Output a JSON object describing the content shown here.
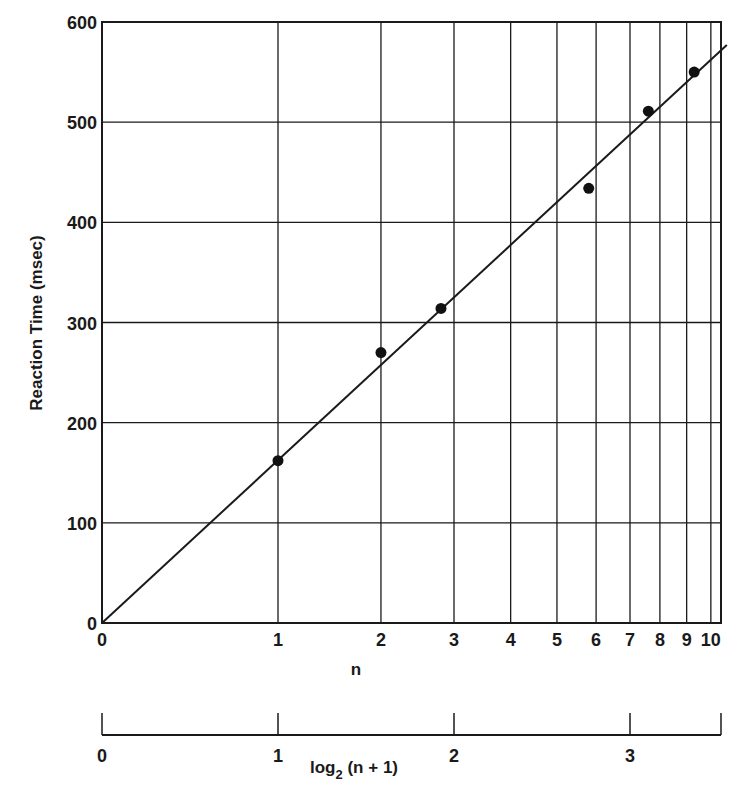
{
  "chart_data": {
    "type": "scatter",
    "title": "",
    "xlabel": "n",
    "xlabel_secondary": "log2 (n + 1)",
    "ylabel": "Reaction Time (msec)",
    "x_scale": "log2(n+1)",
    "x_ticks_n": [
      "0",
      "1",
      "2",
      "3",
      "4",
      "5",
      "6",
      "7",
      "8",
      "9",
      "10"
    ],
    "x_ticks_log": [
      "0",
      "1",
      "2",
      "3"
    ],
    "y_ticks": [
      "0",
      "100",
      "200",
      "300",
      "400",
      "500",
      "600"
    ],
    "ylim": [
      0,
      600
    ],
    "xlim_log": [
      0,
      3.55
    ],
    "grid": true,
    "legend": null,
    "points": [
      {
        "n": 1,
        "rt": 162
      },
      {
        "n": 2,
        "rt": 270
      },
      {
        "n": 2.8,
        "rt": 314
      },
      {
        "n": 5.8,
        "rt": 434
      },
      {
        "n": 7.6,
        "rt": 511
      },
      {
        "n": 9.3,
        "rt": 550
      }
    ],
    "fit_line": {
      "intercept": 0,
      "slope_per_log2_unit": 162,
      "from_log": 0,
      "to_log": 3.55,
      "y_end": 577
    }
  },
  "labels": {
    "ylabel": "Reaction Time (msec)",
    "xlabel_n": "n",
    "xlabel_log_prefix": "log",
    "xlabel_log_sub": "2",
    "xlabel_log_suffix": " (n + 1)"
  }
}
